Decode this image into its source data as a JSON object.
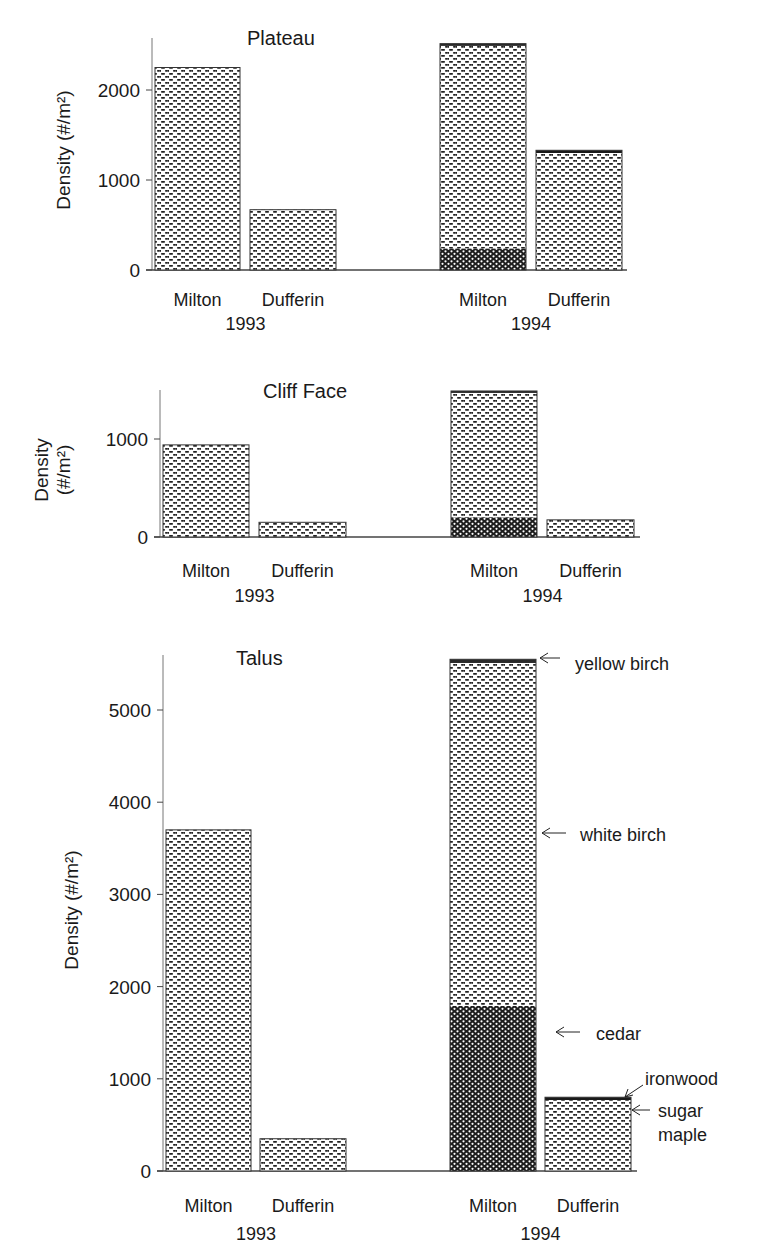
{
  "figure": {
    "legend_annotations": [
      {
        "label": "yellow birch"
      },
      {
        "label": "white birch"
      },
      {
        "label": "cedar"
      },
      {
        "label": "ironwood"
      },
      {
        "label": "sugar maple"
      }
    ]
  },
  "chart_data": [
    {
      "type": "bar",
      "stacked": true,
      "title": "Plateau",
      "ylabel": "Density (#/m²)",
      "xlabel": "",
      "ylim": [
        0,
        2400
      ],
      "yticks": [
        0,
        1000,
        2000
      ],
      "groups": [
        {
          "year": "1993",
          "categories": [
            "Milton",
            "Dufferin"
          ]
        },
        {
          "year": "1994",
          "categories": [
            "Milton",
            "Dufferin"
          ]
        }
      ],
      "categories": [
        "Milton 1993",
        "Dufferin 1993",
        "Milton 1994",
        "Dufferin 1994"
      ],
      "series": [
        {
          "name": "sugar maple",
          "values": [
            0,
            0,
            0,
            40
          ]
        },
        {
          "name": "cedar",
          "values": [
            0,
            0,
            240,
            0
          ]
        },
        {
          "name": "white birch",
          "values": [
            2250,
            670,
            2250,
            1260
          ]
        },
        {
          "name": "ironwood",
          "values": [
            0,
            0,
            0,
            30
          ]
        },
        {
          "name": "yellow birch",
          "values": [
            0,
            0,
            25,
            0
          ]
        }
      ],
      "totals": [
        2250,
        670,
        2515,
        1330
      ],
      "grid": false
    },
    {
      "type": "bar",
      "stacked": true,
      "title": "Cliff Face",
      "ylabel": "Density (#/m²)",
      "xlabel": "",
      "ylim": [
        0,
        1500
      ],
      "yticks": [
        0,
        1000
      ],
      "groups": [
        {
          "year": "1993",
          "categories": [
            "Milton",
            "Dufferin"
          ]
        },
        {
          "year": "1994",
          "categories": [
            "Milton",
            "Dufferin"
          ]
        }
      ],
      "categories": [
        "Milton 1993",
        "Dufferin 1993",
        "Milton 1994",
        "Dufferin 1994"
      ],
      "series": [
        {
          "name": "sugar maple",
          "values": [
            0,
            0,
            0,
            0
          ]
        },
        {
          "name": "cedar",
          "values": [
            0,
            0,
            200,
            0
          ]
        },
        {
          "name": "white birch",
          "values": [
            940,
            150,
            1270,
            175
          ]
        },
        {
          "name": "ironwood",
          "values": [
            0,
            0,
            0,
            0
          ]
        },
        {
          "name": "yellow birch",
          "values": [
            0,
            0,
            20,
            0
          ]
        }
      ],
      "totals": [
        940,
        150,
        1490,
        175
      ],
      "grid": false
    },
    {
      "type": "bar",
      "stacked": true,
      "title": "Talus",
      "ylabel": "Density (#/m²)",
      "xlabel": "",
      "ylim": [
        0,
        5600
      ],
      "yticks": [
        0,
        1000,
        2000,
        3000,
        4000,
        5000
      ],
      "groups": [
        {
          "year": "1993",
          "categories": [
            "Milton",
            "Dufferin"
          ]
        },
        {
          "year": "1994",
          "categories": [
            "Milton",
            "Dufferin"
          ]
        }
      ],
      "categories": [
        "Milton 1993",
        "Dufferin 1993",
        "Milton 1994",
        "Dufferin 1994"
      ],
      "series": [
        {
          "name": "sugar maple",
          "values": [
            0,
            0,
            0,
            770
          ]
        },
        {
          "name": "cedar",
          "values": [
            0,
            0,
            1790,
            0
          ]
        },
        {
          "name": "white birch",
          "values": [
            3700,
            350,
            3720,
            0
          ]
        },
        {
          "name": "ironwood",
          "values": [
            0,
            0,
            0,
            30
          ]
        },
        {
          "name": "yellow birch",
          "values": [
            0,
            0,
            40,
            0
          ]
        }
      ],
      "totals": [
        3700,
        350,
        5550,
        800
      ],
      "annotations": [
        {
          "text": "yellow birch",
          "target": "Milton 1994 top"
        },
        {
          "text": "white birch",
          "target": "Milton 1994 upper segment"
        },
        {
          "text": "cedar",
          "target": "Milton 1994 lower segment"
        },
        {
          "text": "ironwood",
          "target": "Dufferin 1994 top band"
        },
        {
          "text": "sugar maple",
          "target": "Dufferin 1994 main segment"
        }
      ],
      "grid": false
    }
  ]
}
